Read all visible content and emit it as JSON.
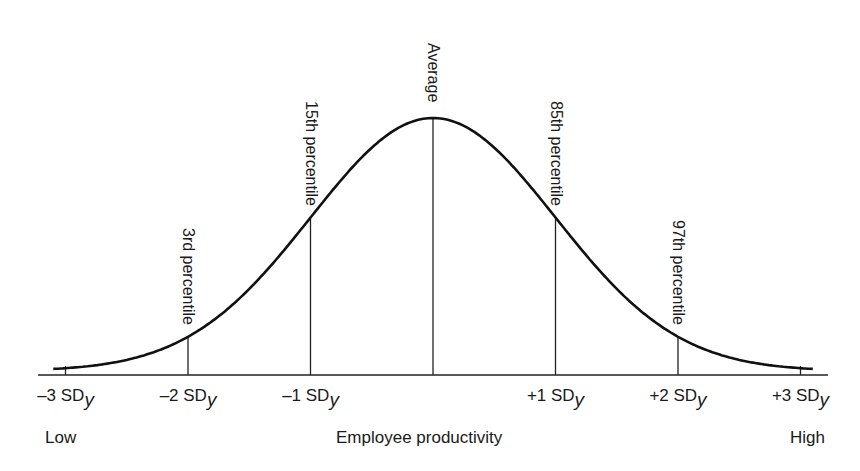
{
  "chart_data": {
    "type": "line",
    "title": "",
    "xlabel": "Employee productivity",
    "ylabel": "",
    "x_low_label": "Low",
    "x_high_label": "High",
    "distribution": "normal",
    "x": [
      -3,
      -2,
      -1,
      0,
      1,
      2,
      3
    ],
    "tick_labels": [
      {
        "prefix": "–3 SD",
        "sub": "y"
      },
      {
        "prefix": "–2 SD",
        "sub": "y"
      },
      {
        "prefix": "–1 SD",
        "sub": "y"
      },
      {
        "prefix": "",
        "sub": ""
      },
      {
        "prefix": "+1 SD",
        "sub": "y"
      },
      {
        "prefix": "+2 SD",
        "sub": "y"
      },
      {
        "prefix": "+3 SD",
        "sub": "y"
      }
    ],
    "annotations": [
      {
        "x": -2,
        "label": "3rd percentile"
      },
      {
        "x": -1,
        "label": "15th percentile"
      },
      {
        "x": 0,
        "label": "Average"
      },
      {
        "x": 1,
        "label": "85th percentile"
      },
      {
        "x": 2,
        "label": "97th percentile"
      }
    ],
    "xlim": [
      -3.1,
      3.1
    ],
    "grid": false,
    "legend": "none",
    "line_color": "#111111"
  },
  "layout": {
    "baseline_y": 375,
    "peak_y": 118,
    "x_zero_px": 433,
    "px_per_sd": 122.5,
    "axis_x_start": 38,
    "axis_x_end": 828
  }
}
